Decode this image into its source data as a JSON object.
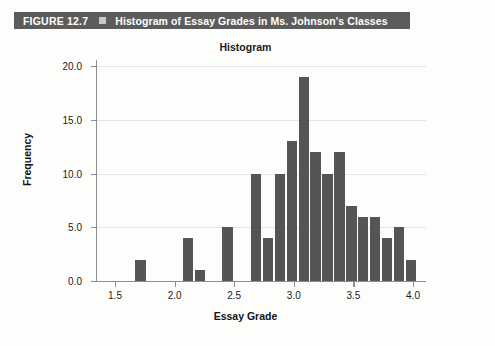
{
  "figure": {
    "number_label": "FIGURE 12.7",
    "bullet_icon": "square-bullet-icon",
    "title": "Histogram of Essay Grades in Ms. Johnson's Classes",
    "bar_color": "#5c5c5c",
    "bar_text_color": "#ffffff"
  },
  "chart_data": {
    "type": "bar",
    "title": "Histogram",
    "xlabel": "Essay  Grade",
    "ylabel": "Frequency",
    "xlim": [
      1.45,
      4.12
    ],
    "ylim": [
      0,
      21
    ],
    "grid": true,
    "legend": "none",
    "bar_color": "#555555",
    "bin_width": 0.1,
    "xticks": [
      "1.5",
      "2.0",
      "2.5",
      "3.0",
      "3.5",
      "4.0"
    ],
    "xtick_values": [
      1.5,
      2.0,
      2.5,
      3.0,
      3.5,
      4.0
    ],
    "yticks": [
      "0.0",
      "5.0",
      "10.0",
      "15.0",
      "20.0"
    ],
    "ytick_values": [
      0,
      5,
      10,
      15,
      20
    ],
    "bins": [
      {
        "left": 1.67,
        "center": 1.72,
        "value": 2
      },
      {
        "left": 2.07,
        "center": 2.12,
        "value": 4
      },
      {
        "left": 2.17,
        "center": 2.22,
        "value": 1
      },
      {
        "left": 2.4,
        "center": 2.45,
        "value": 5
      },
      {
        "left": 2.64,
        "center": 2.69,
        "value": 10
      },
      {
        "left": 2.74,
        "center": 2.79,
        "value": 4
      },
      {
        "left": 2.84,
        "center": 2.89,
        "value": 10
      },
      {
        "left": 2.94,
        "center": 2.99,
        "value": 13
      },
      {
        "left": 3.04,
        "center": 3.09,
        "value": 19
      },
      {
        "left": 3.14,
        "center": 3.19,
        "value": 12
      },
      {
        "left": 3.24,
        "center": 3.29,
        "value": 10
      },
      {
        "left": 3.34,
        "center": 3.39,
        "value": 12
      },
      {
        "left": 3.44,
        "center": 3.49,
        "value": 7
      },
      {
        "left": 3.54,
        "center": 3.59,
        "value": 6
      },
      {
        "left": 3.64,
        "center": 3.69,
        "value": 6
      },
      {
        "left": 3.74,
        "center": 3.79,
        "value": 4
      },
      {
        "left": 3.84,
        "center": 3.89,
        "value": 5
      },
      {
        "left": 3.94,
        "center": 3.99,
        "value": 2
      }
    ]
  }
}
